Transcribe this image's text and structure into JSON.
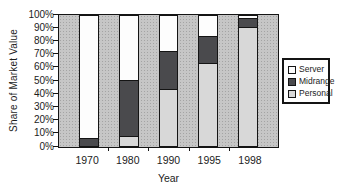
{
  "chart_data": {
    "type": "bar",
    "stacked": true,
    "title": "",
    "xlabel": "Year",
    "ylabel": "Share of Market Value",
    "categories": [
      "1970",
      "1980",
      "1990",
      "1995",
      "1998"
    ],
    "series": [
      {
        "name": "Server",
        "color": "#fdfdfd",
        "values": [
          93,
          49,
          27,
          16,
          2
        ]
      },
      {
        "name": "Midrange",
        "color": "#4a4a4d",
        "values": [
          7,
          43,
          29,
          20,
          7
        ]
      },
      {
        "name": "Personal",
        "color": "#d8d8d8",
        "values": [
          0,
          8,
          44,
          64,
          91
        ]
      }
    ],
    "y_tick_labels": [
      "0%",
      "10%",
      "20%",
      "30%",
      "40%",
      "50%",
      "60%",
      "70%",
      "80%",
      "90%",
      "100%"
    ],
    "ylim": [
      0,
      100
    ],
    "grid": false,
    "legend_position": "right",
    "plot_background": "#c6c6c6",
    "bar_border_color": "#141414"
  }
}
